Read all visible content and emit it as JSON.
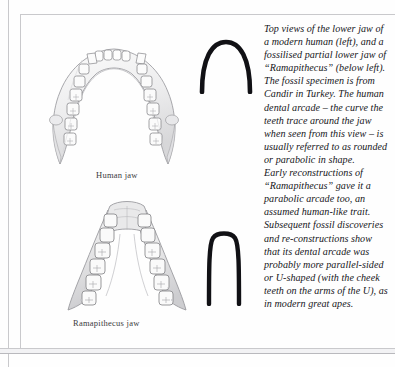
{
  "page": {
    "background_color": "#fefefe",
    "rule_color": "#c9c9cc",
    "ink_color": "#16161a"
  },
  "figures": {
    "human_jaw": {
      "caption": "Human jaw",
      "description": "Top view of the lower jaw of a modern human, rounded parabolic dental arcade",
      "tooth_count": 16
    },
    "ramapithecus_jaw": {
      "caption": "Ramapithecus jaw",
      "description": "Top view of a fossilised partial lower jaw of Ramapithecus, narrow U-shaped dental arcade",
      "tooth_count": 12
    }
  },
  "diagrams": {
    "parabolic_arc": {
      "name": "parabolic-arcade-curve",
      "shape": "parabolic",
      "stroke_color": "#111115"
    },
    "u_shaped_arc": {
      "name": "u-shaped-arcade-curve",
      "shape": "u-shaped",
      "stroke_color": "#111115"
    }
  },
  "text": {
    "paragraph_1": "Top views of the lower jaw of a modern human (left), and a fossilised partial lower jaw of “Ramapithecus” (below left). The fossil specimen is from Candir in Turkey. The human dental arcade – the curve the teeth trace around the jaw when seen from this view – is usually referred to as rounded or parabolic in shape.",
    "paragraph_2": "Early reconstructions of “Ramapithecus” gave it a parabolic arcade too, an assumed human-like trait. Subsequent fossil discoveries and re-constructions show that its dental arcade was probably more parallel-sided or U-shaped (with the cheek teeth on the arms of the U), as in modern great apes."
  }
}
